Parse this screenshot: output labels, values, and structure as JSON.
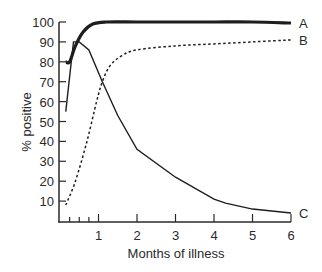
{
  "chart_data": {
    "type": "line",
    "title": "",
    "xlabel": "Months of illness",
    "ylabel": "% positive",
    "xlim": [
      0,
      6
    ],
    "ylim": [
      0,
      100
    ],
    "x_ticks": [
      "1",
      "2",
      "3",
      "4",
      "5",
      "6"
    ],
    "x_minor_ticks": [
      0.25,
      0.5,
      0.75
    ],
    "y_ticks": [
      "10",
      "20",
      "30",
      "40",
      "50",
      "60",
      "70",
      "80",
      "90",
      "100"
    ],
    "grid": false,
    "legend": "inline end labels",
    "series": [
      {
        "name": "A",
        "style": "thick solid",
        "points": [
          [
            0.15,
            80
          ],
          [
            0.25,
            80
          ],
          [
            0.4,
            88
          ],
          [
            0.6,
            95
          ],
          [
            0.85,
            99
          ],
          [
            1.2,
            100
          ],
          [
            2,
            100
          ],
          [
            3,
            100
          ],
          [
            4,
            100
          ],
          [
            5,
            100
          ],
          [
            6,
            99.5
          ]
        ]
      },
      {
        "name": "B",
        "style": "dotted",
        "points": [
          [
            0.15,
            8
          ],
          [
            0.4,
            20
          ],
          [
            0.7,
            40
          ],
          [
            0.95,
            60
          ],
          [
            1.1,
            70
          ],
          [
            1.3,
            78
          ],
          [
            1.6,
            83
          ],
          [
            2,
            86
          ],
          [
            3,
            88
          ],
          [
            4,
            89
          ],
          [
            5,
            90
          ],
          [
            6,
            91
          ]
        ]
      },
      {
        "name": "C",
        "style": "thin solid",
        "points": [
          [
            0.15,
            55
          ],
          [
            0.35,
            90
          ],
          [
            0.5,
            90
          ],
          [
            0.75,
            86
          ],
          [
            1.1,
            70
          ],
          [
            1.5,
            53
          ],
          [
            2,
            36
          ],
          [
            3,
            22
          ],
          [
            4,
            11
          ],
          [
            4.3,
            9
          ],
          [
            5,
            6
          ],
          [
            6,
            4
          ]
        ]
      }
    ]
  }
}
